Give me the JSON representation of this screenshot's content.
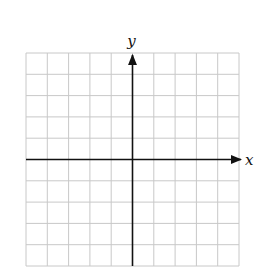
{
  "diagram": {
    "type": "coordinate-grid",
    "grid": {
      "columns": 10,
      "rows": 10,
      "left": 26,
      "top": 53,
      "cell_size": 21.3,
      "line_color": "#c8c8c8"
    },
    "axes": {
      "color": "#111111",
      "x_label": "x",
      "y_label": "y",
      "origin_col": 5,
      "origin_row": 5
    }
  }
}
